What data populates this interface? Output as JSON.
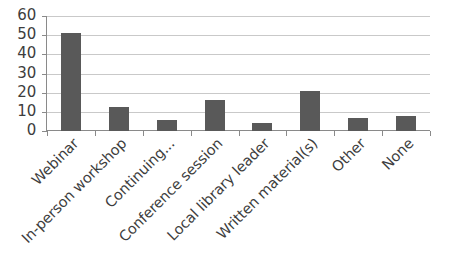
{
  "chart_data": {
    "type": "bar",
    "title": "",
    "subtitle": "",
    "xlabel": "",
    "ylabel": "",
    "categories": [
      "Webinar",
      "In-person workshop",
      "Continuing...",
      "Conference session",
      "Local library leader",
      "Written material(s)",
      "Other",
      "None"
    ],
    "values": [
      51,
      12.5,
      6,
      16,
      4,
      21,
      7,
      8
    ],
    "ylim": [
      0,
      60
    ],
    "ytick_labels": [
      "60",
      "50",
      "40",
      "30",
      "20",
      "10",
      "0"
    ],
    "ytick_values": [
      60,
      50,
      40,
      30,
      20,
      10,
      0
    ],
    "ytick_step": 10,
    "grid": true,
    "grid_axis": "y",
    "legend": false,
    "legend_position": "none",
    "series": [
      {
        "name": "",
        "values": [
          51,
          12.5,
          6,
          16,
          4,
          21,
          7,
          8
        ]
      }
    ],
    "colors": {
      "bar": "#595959",
      "grid": "#c9c9c9",
      "axis": "#8a8a8a",
      "text": "#3d3d3d",
      "background": "#ffffff"
    },
    "x_label_rotation": -45,
    "annotations": []
  }
}
